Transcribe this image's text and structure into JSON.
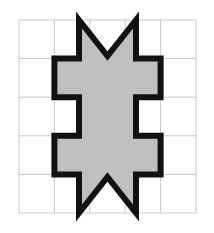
{
  "figure": {
    "background_color": "#ffffff",
    "canvas": {
      "width": 214,
      "height": 233
    }
  },
  "grid": {
    "name": "background-grid",
    "columns": 5,
    "rows": 5,
    "left": 19,
    "top": 20,
    "right": 196,
    "bottom": 213,
    "cell_width": 35.4,
    "cell_height": 38.6,
    "line_color": "#c8c8c8",
    "line_width": 1,
    "x_lines": [
      19,
      54.4,
      89.8,
      125.2,
      160.6,
      196
    ],
    "y_lines": [
      20,
      58.6,
      97.2,
      135.8,
      174.4,
      213
    ]
  },
  "shape": {
    "name": "castellated-polygon",
    "fill_color": "#bfbfbf",
    "stroke_color": "#111111",
    "stroke_width": 6,
    "symmetry": "bilateral-vertical",
    "axis_x": 107.5,
    "features": {
      "top_notch": "V-notch, apex down at (107.5, 56)",
      "bottom_notch": "caret notch, apex up at (107.5, 177)",
      "left_arms": 3,
      "right_arms": 3
    },
    "points": [
      [
        79,
        20
      ],
      [
        107.5,
        56
      ],
      [
        136,
        20
      ],
      [
        136,
        58.6
      ],
      [
        160.6,
        58.6
      ],
      [
        160.6,
        97.2
      ],
      [
        136,
        97.2
      ],
      [
        136,
        135.8
      ],
      [
        160.6,
        135.8
      ],
      [
        160.6,
        174.4
      ],
      [
        136,
        174.4
      ],
      [
        136,
        213
      ],
      [
        107.5,
        177
      ],
      [
        79,
        213
      ],
      [
        79,
        174.4
      ],
      [
        54.4,
        174.4
      ],
      [
        54.4,
        135.8
      ],
      [
        79,
        135.8
      ],
      [
        79,
        97.2
      ],
      [
        54.4,
        97.2
      ],
      [
        54.4,
        58.6
      ],
      [
        79,
        58.6
      ]
    ]
  }
}
